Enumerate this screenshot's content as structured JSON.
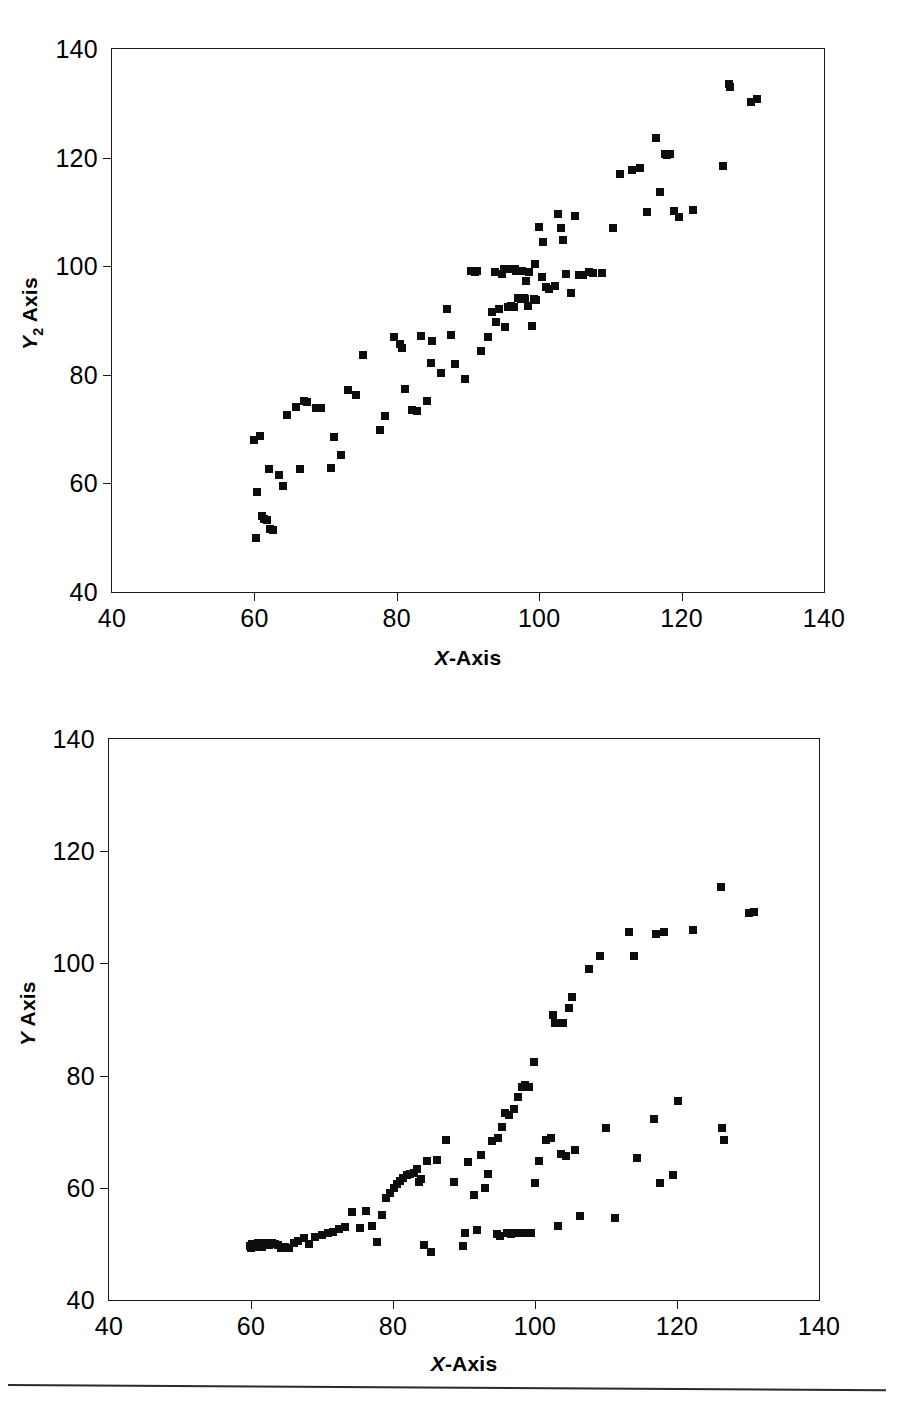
{
  "figure": {
    "bottom_rule": "horizontal-rule"
  },
  "charts": [
    {
      "id": "chart-top",
      "y_axis_title_main": "Y",
      "y_axis_title_sub": "2",
      "y_axis_title_suffix": " Axis",
      "x_axis_title_var": "X",
      "x_axis_title_suffix": "-Axis"
    },
    {
      "id": "chart-bottom",
      "y_axis_title_main": "Y",
      "y_axis_title_sub": "",
      "y_axis_title_suffix": " Axis",
      "x_axis_title_var": "X",
      "x_axis_title_suffix": "-Axis"
    }
  ],
  "chart_data": [
    {
      "type": "scatter",
      "title": "",
      "xlabel": "X-Axis",
      "ylabel": "Y2 Axis",
      "xlim": [
        40,
        140
      ],
      "ylim": [
        40,
        140
      ],
      "xticks": [
        40,
        60,
        80,
        100,
        120,
        140
      ],
      "yticks": [
        40,
        60,
        80,
        100,
        120,
        140
      ],
      "grid": false,
      "legend": false,
      "marker": "square",
      "marker_color": "#0d0d0d",
      "n_points": 108,
      "points": [
        [
          60.0,
          68.0
        ],
        [
          60.2,
          50.0
        ],
        [
          60.4,
          58.5
        ],
        [
          60.8,
          68.8
        ],
        [
          61.0,
          54.0
        ],
        [
          61.4,
          53.4
        ],
        [
          61.8,
          53.2
        ],
        [
          62.0,
          62.6
        ],
        [
          62.2,
          51.6
        ],
        [
          62.6,
          51.4
        ],
        [
          63.4,
          61.6
        ],
        [
          64.0,
          59.6
        ],
        [
          64.6,
          72.6
        ],
        [
          65.8,
          74.0
        ],
        [
          66.4,
          62.6
        ],
        [
          67.0,
          75.2
        ],
        [
          67.4,
          75.0
        ],
        [
          68.6,
          73.8
        ],
        [
          69.4,
          73.8
        ],
        [
          70.8,
          62.8
        ],
        [
          71.2,
          68.6
        ],
        [
          72.2,
          65.2
        ],
        [
          73.2,
          77.2
        ],
        [
          74.2,
          76.2
        ],
        [
          75.2,
          83.6
        ],
        [
          77.6,
          69.8
        ],
        [
          78.4,
          72.4
        ],
        [
          79.6,
          87.0
        ],
        [
          80.4,
          85.6
        ],
        [
          80.8,
          85.0
        ],
        [
          81.2,
          77.4
        ],
        [
          82.2,
          73.6
        ],
        [
          82.8,
          73.4
        ],
        [
          83.4,
          87.2
        ],
        [
          84.2,
          75.2
        ],
        [
          84.8,
          82.2
        ],
        [
          85.0,
          86.2
        ],
        [
          86.2,
          80.4
        ],
        [
          87.0,
          92.2
        ],
        [
          87.6,
          87.4
        ],
        [
          88.2,
          82.0
        ],
        [
          89.6,
          79.2
        ],
        [
          90.4,
          99.2
        ],
        [
          91.2,
          99.2
        ],
        [
          91.8,
          84.4
        ],
        [
          92.8,
          87.0
        ],
        [
          93.4,
          91.6
        ],
        [
          93.8,
          99.0
        ],
        [
          94.0,
          89.8
        ],
        [
          94.4,
          92.2
        ],
        [
          94.8,
          98.6
        ],
        [
          95.0,
          99.4
        ],
        [
          95.2,
          88.8
        ],
        [
          95.6,
          92.4
        ],
        [
          96.0,
          92.6
        ],
        [
          96.2,
          99.4
        ],
        [
          96.6,
          99.4
        ],
        [
          96.8,
          99.2
        ],
        [
          97.0,
          94.2
        ],
        [
          97.2,
          94.2
        ],
        [
          97.4,
          94.0
        ],
        [
          97.6,
          99.2
        ],
        [
          98.0,
          94.0
        ],
        [
          98.2,
          97.2
        ],
        [
          98.6,
          99.0
        ],
        [
          99.0,
          89.0
        ],
        [
          99.4,
          100.4
        ],
        [
          99.6,
          93.8
        ],
        [
          100.0,
          107.2
        ],
        [
          100.4,
          98.0
        ],
        [
          100.6,
          104.4
        ],
        [
          101.0,
          96.2
        ],
        [
          101.4,
          95.8
        ],
        [
          102.2,
          96.4
        ],
        [
          102.6,
          109.6
        ],
        [
          103.0,
          107.0
        ],
        [
          103.4,
          104.8
        ],
        [
          103.8,
          98.6
        ],
        [
          104.4,
          95.0
        ],
        [
          105.0,
          109.2
        ],
        [
          105.6,
          98.4
        ],
        [
          106.2,
          98.4
        ],
        [
          107.0,
          99.0
        ],
        [
          107.6,
          98.8
        ],
        [
          108.8,
          98.8
        ],
        [
          110.4,
          107.0
        ],
        [
          111.4,
          117.0
        ],
        [
          113.0,
          117.8
        ],
        [
          114.2,
          118.0
        ],
        [
          115.2,
          110.0
        ],
        [
          116.4,
          123.6
        ],
        [
          117.0,
          113.6
        ],
        [
          117.6,
          120.6
        ],
        [
          118.0,
          120.4
        ],
        [
          118.4,
          120.6
        ],
        [
          119.0,
          110.2
        ],
        [
          119.6,
          109.0
        ],
        [
          121.6,
          110.4
        ],
        [
          125.8,
          118.4
        ],
        [
          126.6,
          133.6
        ],
        [
          126.8,
          133.0
        ],
        [
          129.8,
          130.2
        ],
        [
          130.6,
          130.8
        ],
        [
          98.4,
          92.6
        ],
        [
          91.0,
          99.0
        ],
        [
          96.4,
          92.4
        ],
        [
          97.8,
          94.2
        ],
        [
          99.2,
          94.0
        ]
      ]
    },
    {
      "type": "scatter",
      "title": "",
      "xlabel": "X-Axis",
      "ylabel": "Y Axis",
      "xlim": [
        40,
        140
      ],
      "ylim": [
        40,
        140
      ],
      "xticks": [
        40,
        60,
        80,
        100,
        120,
        140
      ],
      "yticks": [
        40,
        60,
        80,
        100,
        120,
        140
      ],
      "grid": false,
      "legend": false,
      "marker": "square",
      "marker_color": "#0d0d0d",
      "n_points": 110,
      "points": [
        [
          59.8,
          49.6
        ],
        [
          60.0,
          49.2
        ],
        [
          60.2,
          50.0
        ],
        [
          60.4,
          49.4
        ],
        [
          60.6,
          49.8
        ],
        [
          60.8,
          49.4
        ],
        [
          61.0,
          50.2
        ],
        [
          61.2,
          49.6
        ],
        [
          61.4,
          50.0
        ],
        [
          61.6,
          49.4
        ],
        [
          61.8,
          50.2
        ],
        [
          62.2,
          50.0
        ],
        [
          62.6,
          49.8
        ],
        [
          63.0,
          50.2
        ],
        [
          63.4,
          50.0
        ],
        [
          63.8,
          49.8
        ],
        [
          64.2,
          49.2
        ],
        [
          64.8,
          49.4
        ],
        [
          65.4,
          49.2
        ],
        [
          66.0,
          50.2
        ],
        [
          66.6,
          50.6
        ],
        [
          67.4,
          51.0
        ],
        [
          68.2,
          50.0
        ],
        [
          69.0,
          51.2
        ],
        [
          70.0,
          51.6
        ],
        [
          70.8,
          52.0
        ],
        [
          71.6,
          52.2
        ],
        [
          72.4,
          52.6
        ],
        [
          73.2,
          53.0
        ],
        [
          74.2,
          55.6
        ],
        [
          75.4,
          52.8
        ],
        [
          76.2,
          55.8
        ],
        [
          77.0,
          53.2
        ],
        [
          77.8,
          50.4
        ],
        [
          78.4,
          55.2
        ],
        [
          79.0,
          58.2
        ],
        [
          79.6,
          59.0
        ],
        [
          80.2,
          60.0
        ],
        [
          80.6,
          60.6
        ],
        [
          81.0,
          61.2
        ],
        [
          81.4,
          61.8
        ],
        [
          82.0,
          62.2
        ],
        [
          82.4,
          62.4
        ],
        [
          83.0,
          62.6
        ],
        [
          83.4,
          63.4
        ],
        [
          83.6,
          61.0
        ],
        [
          84.0,
          61.6
        ],
        [
          84.4,
          49.8
        ],
        [
          84.8,
          64.8
        ],
        [
          85.4,
          48.6
        ],
        [
          86.2,
          65.0
        ],
        [
          87.4,
          68.6
        ],
        [
          88.6,
          61.0
        ],
        [
          89.8,
          49.6
        ],
        [
          90.2,
          52.0
        ],
        [
          90.6,
          64.6
        ],
        [
          91.4,
          58.8
        ],
        [
          91.8,
          52.4
        ],
        [
          92.4,
          65.8
        ],
        [
          93.0,
          60.0
        ],
        [
          93.4,
          62.4
        ],
        [
          94.0,
          68.4
        ],
        [
          94.6,
          51.8
        ],
        [
          94.8,
          68.8
        ],
        [
          95.0,
          51.4
        ],
        [
          95.4,
          70.8
        ],
        [
          95.8,
          73.4
        ],
        [
          96.0,
          52.0
        ],
        [
          96.4,
          73.0
        ],
        [
          96.6,
          51.8
        ],
        [
          97.0,
          74.0
        ],
        [
          97.2,
          52.0
        ],
        [
          97.6,
          76.2
        ],
        [
          97.8,
          52.0
        ],
        [
          98.2,
          78.0
        ],
        [
          98.4,
          52.0
        ],
        [
          98.6,
          78.4
        ],
        [
          99.0,
          52.0
        ],
        [
          99.2,
          78.0
        ],
        [
          99.4,
          52.0
        ],
        [
          99.8,
          82.4
        ],
        [
          100.0,
          60.8
        ],
        [
          100.6,
          64.8
        ],
        [
          101.6,
          68.6
        ],
        [
          102.2,
          68.8
        ],
        [
          102.6,
          90.8
        ],
        [
          102.8,
          89.4
        ],
        [
          103.2,
          53.2
        ],
        [
          103.6,
          66.0
        ],
        [
          104.0,
          89.4
        ],
        [
          104.4,
          65.6
        ],
        [
          104.8,
          92.0
        ],
        [
          105.2,
          94.0
        ],
        [
          105.6,
          66.8
        ],
        [
          106.4,
          55.0
        ],
        [
          107.6,
          99.0
        ],
        [
          109.2,
          101.4
        ],
        [
          110.0,
          70.6
        ],
        [
          111.2,
          54.6
        ],
        [
          113.2,
          105.6
        ],
        [
          114.0,
          101.4
        ],
        [
          114.4,
          65.4
        ],
        [
          116.8,
          72.2
        ],
        [
          117.0,
          105.2
        ],
        [
          117.6,
          60.8
        ],
        [
          118.2,
          105.6
        ],
        [
          119.4,
          62.2
        ],
        [
          120.2,
          75.4
        ],
        [
          122.2,
          106.0
        ],
        [
          126.2,
          113.6
        ],
        [
          126.4,
          70.6
        ],
        [
          126.6,
          68.6
        ],
        [
          130.2,
          109.0
        ],
        [
          130.8,
          109.2
        ]
      ]
    }
  ]
}
